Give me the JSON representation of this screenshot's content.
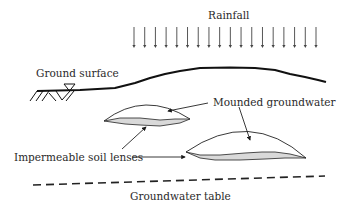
{
  "diagram": {
    "labels": {
      "rainfall": "Rainfall",
      "ground_surface": "Ground surface",
      "mounded_groundwater": "Mounded groundwater",
      "impermeable_soil_lenses": "Impermeable soil lenses",
      "groundwater_table": "Groundwater table"
    },
    "rainfall": {
      "arrow_count": 18,
      "x_start": 134,
      "x_end": 316,
      "y_top": 27,
      "y_bottom": 48
    },
    "symbols": {
      "water_table_marker": "inverted-triangle",
      "ground_hatch": "diagonal-hatching"
    },
    "colors": {
      "line": "#1a1a1a",
      "lens_fill": "#d9d9d9",
      "text": "#2a2a2a"
    }
  }
}
